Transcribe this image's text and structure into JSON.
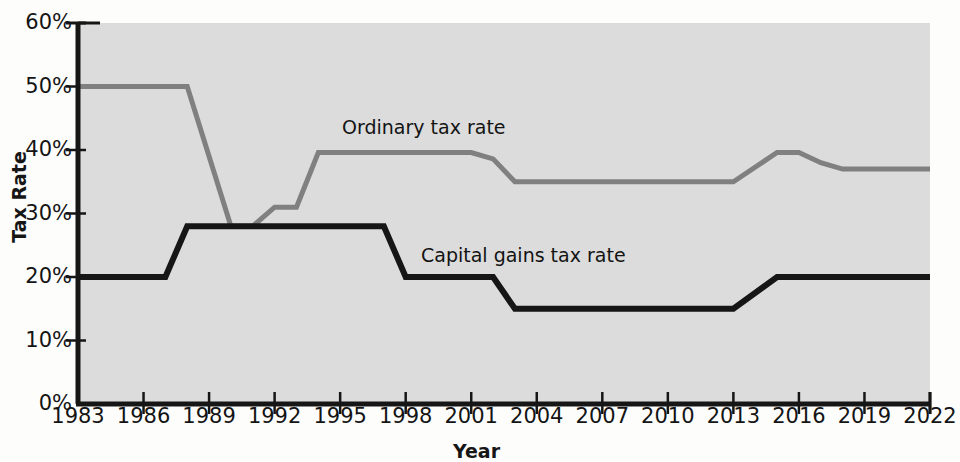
{
  "chart_data": {
    "type": "line",
    "title": "",
    "xlabel": "Year",
    "ylabel": "Tax Rate",
    "xlim": [
      1983,
      2022
    ],
    "ylim": [
      0,
      60
    ],
    "y_tick_labels": [
      "0%",
      "10%",
      "20%",
      "30%",
      "40%",
      "50%",
      "60%"
    ],
    "y_ticks": [
      0,
      10,
      20,
      30,
      40,
      50,
      60
    ],
    "x_tick_labels": [
      "1983",
      "1986",
      "1989",
      "1992",
      "1995",
      "1998",
      "2001",
      "2004",
      "2007",
      "2010",
      "2013",
      "2016",
      "2019",
      "2022"
    ],
    "x_ticks": [
      1983,
      1986,
      1989,
      1992,
      1995,
      1998,
      2001,
      2004,
      2007,
      2010,
      2013,
      2016,
      2019,
      2022
    ],
    "grid": false,
    "legend_position": "inline-annotations",
    "plot_background": "#dcdcdc",
    "series": [
      {
        "name": "Ordinary tax rate",
        "color": "#808080",
        "line_width": 5,
        "x": [
          1983,
          1986,
          1987,
          1988,
          1990,
          1991,
          1992,
          1993,
          1994,
          2000,
          2001,
          2002,
          2003,
          2012,
          2013,
          2015,
          2016,
          2017,
          2018,
          2022
        ],
        "values": [
          50,
          50,
          50,
          50,
          28,
          28,
          31,
          31,
          39.6,
          39.6,
          39.6,
          38.6,
          35,
          35,
          35,
          39.6,
          39.6,
          38,
          37,
          37
        ]
      },
      {
        "name": "Capital gains tax rate",
        "color": "#161616",
        "line_width": 6,
        "x": [
          1983,
          1986,
          1987,
          1988,
          1990,
          1992,
          1996,
          1997,
          1998,
          2002,
          2003,
          2004,
          2012,
          2013,
          2015,
          2016,
          2022
        ],
        "values": [
          20,
          20,
          20,
          28,
          28,
          28,
          28,
          28,
          20,
          20,
          15,
          15,
          15,
          15,
          20,
          20,
          20
        ]
      }
    ],
    "annotations": [
      {
        "text": "Ordinary tax rate",
        "series": "Ordinary tax rate"
      },
      {
        "text": "Capital gains tax rate",
        "series": "Capital gains tax rate"
      }
    ]
  }
}
